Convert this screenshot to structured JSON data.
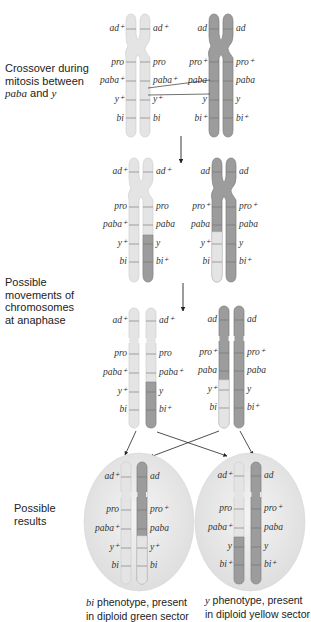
{
  "colors": {
    "light_chromosome": "#e4e4e4",
    "light_chromosome_edge": "#cfcfcf",
    "dark_chromosome": "#9c9c9c",
    "dark_chromosome_edge": "#7d7d7d",
    "band_line": "#6f6f6f",
    "cell_fill": "#e8e8e8",
    "arrow": "#222222"
  },
  "stages": [
    {
      "id": "crossover",
      "label_parts": [
        "Crossover during",
        "mitosis between",
        "paba",
        " and ",
        "y"
      ]
    },
    {
      "id": "after-crossover",
      "label_parts": []
    },
    {
      "id": "anaphase",
      "label_parts": [
        "Possible",
        "movements of",
        "chromosomes",
        "at anaphase"
      ]
    },
    {
      "id": "results",
      "label_parts": [
        "Possible",
        "results"
      ]
    }
  ],
  "genes": {
    "crossover": {
      "light_left": [
        "ad+",
        "pro",
        "paba+",
        "y+",
        "bi"
      ],
      "light_right": [
        "ad+",
        "pro",
        "paba+",
        "y+",
        "bi"
      ],
      "dark_left": [
        "ad",
        "pro+",
        "paba",
        "y",
        "bi+"
      ],
      "dark_right": [
        "ad",
        "pro+",
        "paba",
        "y",
        "bi+"
      ]
    },
    "after_crossover": {
      "light_left": [
        "ad+",
        "pro",
        "paba+",
        "y+",
        "bi"
      ],
      "light_right": [
        "ad+",
        "pro",
        "paba",
        "y",
        "bi+"
      ],
      "dark_left": [
        "ad",
        "pro+",
        "paba",
        "y+",
        "bi"
      ],
      "dark_right": [
        "ad",
        "pro+",
        "paba",
        "y",
        "bi+"
      ]
    },
    "anaphase": {
      "c1": [
        "ad+",
        "pro",
        "paba+",
        "y+",
        "bi"
      ],
      "c2": [
        "ad+",
        "pro",
        "paba+",
        "y",
        "bi+"
      ],
      "c3": [
        "ad",
        "pro+",
        "paba",
        "y+",
        "bi"
      ],
      "c4": [
        "ad",
        "pro+",
        "paba",
        "y",
        "bi+"
      ]
    },
    "results": {
      "green_sector_left": [
        "ad+",
        "pro",
        "paba+",
        "y+",
        "bi"
      ],
      "green_sector_right": [
        "ad",
        "pro+",
        "paba",
        "y+",
        "bi"
      ],
      "yellow_sector_left": [
        "ad+",
        "pro",
        "paba+",
        "y",
        "bi+"
      ],
      "yellow_sector_right": [
        "ad",
        "pro+",
        "paba",
        "y",
        "bi+"
      ]
    }
  },
  "captions": {
    "left": {
      "italic": "bi",
      "line1_rest": " phenotype, present",
      "line2": "in diploid green sector"
    },
    "right": {
      "italic": "y",
      "line1_rest": " phenotype, present",
      "line2": "in diploid yellow sector"
    }
  }
}
